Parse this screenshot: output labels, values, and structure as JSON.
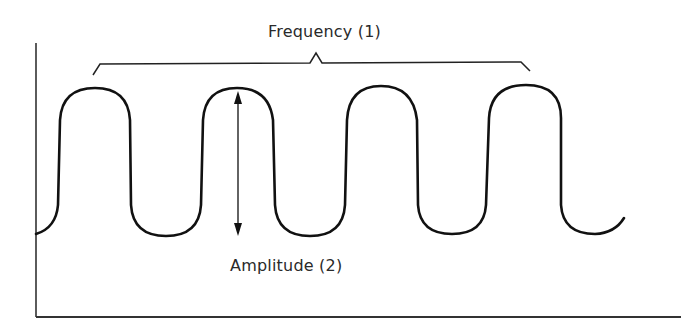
{
  "diagram": {
    "title": "",
    "labels": {
      "frequency": "Frequency (1)",
      "amplitude": "Amplitude (2)"
    },
    "colors": {
      "stroke": "#111111",
      "axis": "#333333",
      "text": "#2a2a2a",
      "background": "#ffffff"
    },
    "wave": {
      "shape": "rounded square wave",
      "crest_count": 4,
      "trough_count": 4
    },
    "annotations": [
      {
        "id": 1,
        "type": "bracket",
        "label": "Frequency (1)",
        "spans": "four cycles"
      },
      {
        "id": 2,
        "type": "double-arrow",
        "label": "Amplitude (2)",
        "spans": "crest to trough"
      }
    ]
  }
}
